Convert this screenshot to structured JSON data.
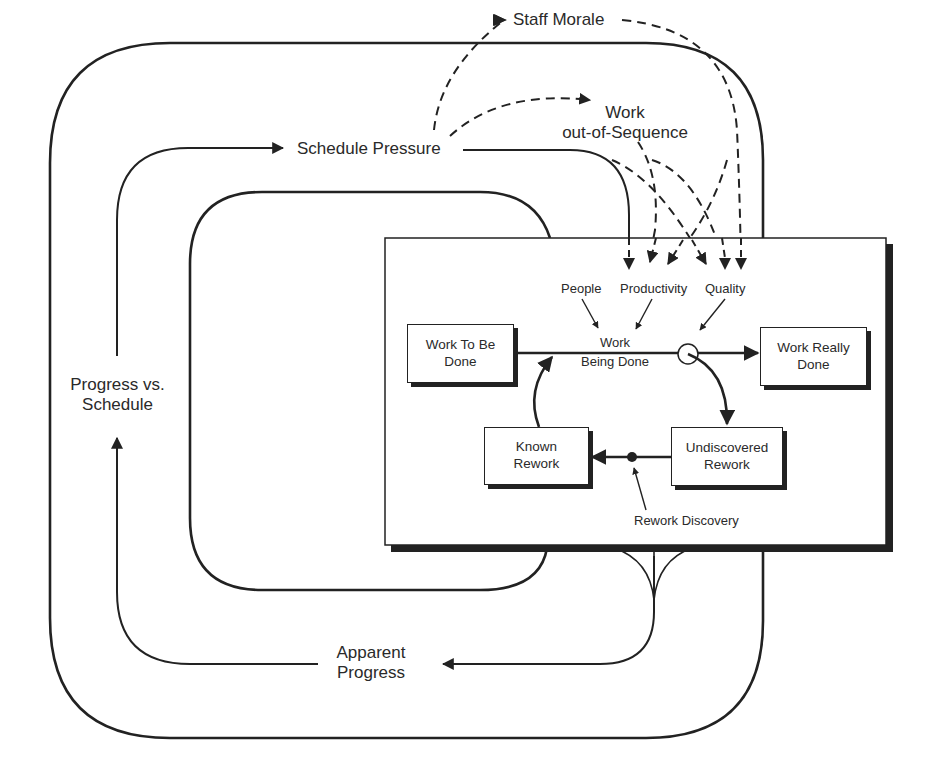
{
  "diagram": {
    "outer_labels": {
      "schedule_pressure": "Schedule Pressure",
      "staff_morale": "Staff Morale",
      "work_out_of_sequence_line1": "Work",
      "work_out_of_sequence_line2": "out-of-Sequence",
      "progress_vs_schedule_line1": "Progress vs.",
      "progress_vs_schedule_line2": "Schedule",
      "apparent_progress_line1": "Apparent",
      "apparent_progress_line2": "Progress"
    },
    "rework_cycle": {
      "auxiliaries": {
        "people": "People",
        "productivity": "Productivity",
        "quality": "Quality"
      },
      "flow_label_line1": "Work",
      "flow_label_line2": "Being Done",
      "rework_discovery": "Rework Discovery",
      "stocks": [
        {
          "id": "work-to-be-done",
          "line1": "Work To Be",
          "line2": "Done"
        },
        {
          "id": "work-really-done",
          "line1": "Work Really",
          "line2": "Done"
        },
        {
          "id": "known-rework",
          "line1": "Known",
          "line2": "Rework"
        },
        {
          "id": "undiscovered-rework",
          "line1": "Undiscovered",
          "line2": "Rework"
        }
      ]
    },
    "colors": {
      "line": "#222222",
      "background": "#ffffff",
      "text": "#2a2a2a"
    }
  }
}
